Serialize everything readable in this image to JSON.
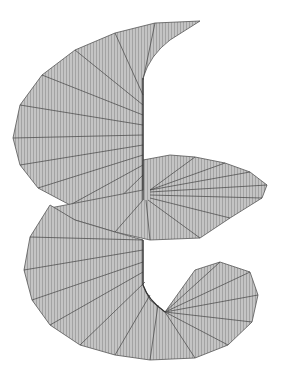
{
  "figure": {
    "background": "#ffffff",
    "surface_fill": "#b8b8b8",
    "line_color": "#555555",
    "turns_visible": 2
  }
}
